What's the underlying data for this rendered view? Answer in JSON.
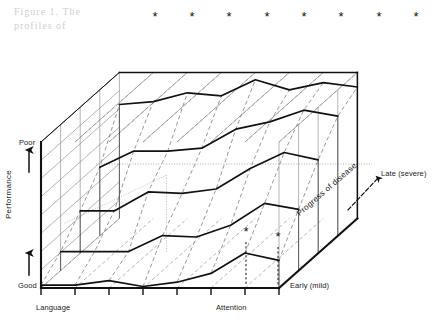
{
  "figure": {
    "domain": "chart",
    "background": "#ffffff",
    "ink": "#111111",
    "grid_color": "#6f6f6f",
    "ghost_text": [
      "Figure 1. The",
      "profiles of"
    ]
  },
  "axes": {
    "y": {
      "title": "Performance",
      "top_label": "Poor",
      "bottom_label": "Good",
      "arrows": [
        "up",
        "up"
      ]
    },
    "x": {
      "left_label": "Language",
      "right_label": "Attention",
      "tick_count": 8,
      "tick_positions_px": [
        41,
        75,
        109,
        143,
        177,
        211,
        245,
        279
      ]
    },
    "z": {
      "title": "Progress of disease",
      "near_label": "Early (mild)",
      "far_label": "Late (severe)",
      "arrow": "up-right"
    }
  },
  "markers": {
    "glyph": "*",
    "top_row_count": 8,
    "top_row_x_px": [
      155,
      192,
      229,
      267,
      304,
      341,
      379,
      416
    ],
    "top_row_y_px": 16,
    "front_markers": [
      {
        "x_px": 246,
        "y_px": 236
      },
      {
        "x_px": 278,
        "y_px": 241
      }
    ]
  },
  "chart_data": {
    "type": "line",
    "title": "",
    "xlabel": "Neuropsychological domain",
    "ylabel": "Performance",
    "zlabel": "Progress of disease",
    "xlim": [
      "Language",
      "Attention"
    ],
    "ylim": [
      "Good",
      "Poor"
    ],
    "zlim": [
      "Early (mild)",
      "Late (severe)"
    ],
    "grid": true,
    "legend": "none",
    "x_categories": [
      "Language",
      "d2",
      "d3",
      "d4",
      "d5",
      "d6",
      "Attention",
      "d8"
    ],
    "note": "Values are performance (0 = Good at baseline, 1 = Poor at ceiling) read off the vertical axis for each disease-stage profile; series are ordered front (earliest disease) to back (latest disease).",
    "series": [
      {
        "name": "Early (mild)",
        "depth_index": 0,
        "values": [
          0.02,
          0.02,
          0.05,
          0.01,
          0.04,
          0.1,
          0.24,
          0.19
        ]
      },
      {
        "name": "Stage 2",
        "depth_index": 1,
        "values": [
          0.13,
          0.13,
          0.13,
          0.24,
          0.23,
          0.31,
          0.46,
          0.42
        ]
      },
      {
        "name": "Stage 3",
        "depth_index": 2,
        "values": [
          0.29,
          0.29,
          0.42,
          0.41,
          0.44,
          0.58,
          0.69,
          0.64
        ]
      },
      {
        "name": "Stage 4",
        "depth_index": 3,
        "values": [
          0.47,
          0.58,
          0.58,
          0.6,
          0.73,
          0.78,
          0.86,
          0.82
        ]
      },
      {
        "name": "Late (severe)",
        "depth_index": 4,
        "values": [
          0.78,
          0.8,
          0.86,
          0.84,
          0.95,
          0.88,
          0.93,
          0.9
        ]
      }
    ],
    "significance_markers": {
      "symbol": "*",
      "back_plane_columns": 8,
      "front_plane_columns": [
        7,
        8
      ]
    },
    "reference_line": {
      "type": "dotted-horizontal",
      "y_px": 164
    }
  }
}
